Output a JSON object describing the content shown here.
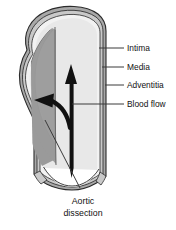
{
  "figure": {
    "type": "medical-anatomy-illustration"
  },
  "labels": {
    "intima": "Intima",
    "media": "Media",
    "adventitia": "Adventitia",
    "blood_flow": "Blood flow",
    "aortic_dissection_line1": "Aortic",
    "aortic_dissection_line2": "dissection"
  },
  "colors": {
    "background": "#ffffff",
    "lumen": "#e8e8e8",
    "intima": "#f2f2f2",
    "media": "#c9c9c9",
    "adventitia": "#a8a8a8",
    "dissection": "#9a9a9a",
    "outline": "#2b2b2b",
    "arrow": "#111111",
    "leader": "#3a3a3a",
    "text": "#111111"
  },
  "parts": {
    "vessel": "aorta-wall",
    "lumen": "true-lumen",
    "false_lumen": "dissection-false-lumen",
    "flow_arrow": "upward-blood-flow-arrow",
    "dissection_arrow": "curved-arrow-into-false-lumen"
  }
}
